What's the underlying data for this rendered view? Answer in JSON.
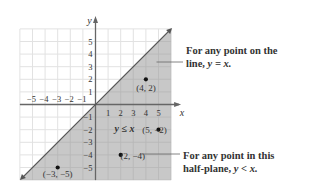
{
  "chart_data": {
    "type": "region",
    "title": "",
    "xlabel": "x",
    "ylabel": "y",
    "xlim": [
      -6,
      6
    ],
    "ylim": [
      -6,
      6
    ],
    "grid": true,
    "x_ticks": [
      -5,
      -4,
      -3,
      -2,
      -1,
      1,
      2,
      3,
      4,
      5
    ],
    "y_ticks": [
      -5,
      -4,
      -3,
      -2,
      -1,
      1,
      2,
      3,
      4,
      5
    ],
    "boundary_line": {
      "equation": "y = x",
      "style": "solid"
    },
    "shaded_region": {
      "inequality": "y ≤ x",
      "label": "y ≤ x"
    },
    "points": [
      {
        "x": 4,
        "y": 2,
        "label": "(4, 2)"
      },
      {
        "x": 5,
        "y": -2,
        "label": "(5, −2)"
      },
      {
        "x": 2,
        "y": -4,
        "label": "(2, −4)"
      },
      {
        "x": -3,
        "y": -5,
        "label": "(−3, −5)"
      }
    ],
    "annotations": [
      {
        "text": "For any point on the line, y = x.",
        "target": "boundary line"
      },
      {
        "text": "For any point in this half-plane, y < x.",
        "target": "shaded half-plane"
      }
    ]
  },
  "labels": {
    "x_axis": "x",
    "y_axis": "y",
    "region": "y ≤ x",
    "callout_line_1": "For any point on the",
    "callout_line_2": "line, ",
    "callout_line_eq": "y = x.",
    "callout_plane_1": "For any point in this",
    "callout_plane_2": "half-plane, ",
    "callout_plane_eq": "y < x."
  },
  "colors": {
    "shade": "#c8c8c8",
    "grid": "#e2e2e2",
    "grid_in_shade": "#b8b8b8",
    "axis": "#666666",
    "line": "#555555",
    "point": "#111111",
    "text": "#333333"
  }
}
